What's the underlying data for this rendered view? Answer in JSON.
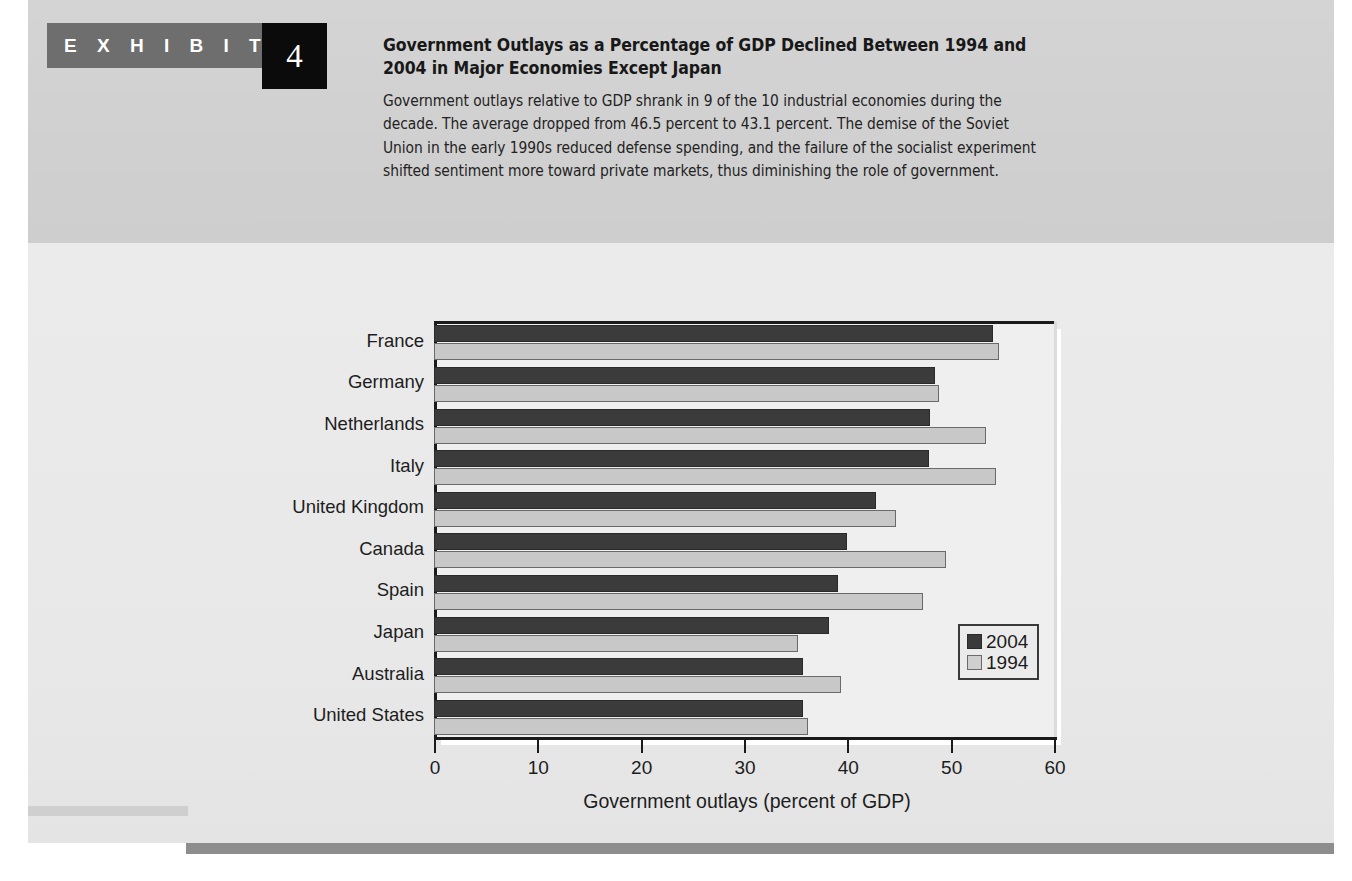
{
  "exhibit": {
    "label": "E X H I B I T",
    "number": "4",
    "title": "Government Outlays as a Percentage of GDP Declined Between 1994 and 2004 in Major Economies Except Japan",
    "description": "Government outlays relative to GDP shrank in 9 of the 10 industrial economies during the decade. The average dropped from 46.5 percent to 43.1 percent. The demise of the Soviet Union in the early 1990s reduced defense spending, and the failure of the socialist experiment shifted sentiment more toward private markets, thus diminishing the role of government."
  },
  "colors": {
    "series_2004": "#3b3b3b",
    "series_1994": "#c8c8c8",
    "ribbon": "#6e6e6e",
    "number_box": "#0b0b0b",
    "header_band": "#d2d2d2",
    "chart_paper": "#e9e9e9",
    "plot_bg": "#efefef",
    "axis": "#1b1b1b",
    "footer_bar": "#8d8d8d"
  },
  "chart_data": {
    "type": "bar",
    "orientation": "horizontal",
    "title": "",
    "xlabel": "Government outlays (percent of GDP)",
    "ylabel": "",
    "xlim": [
      0,
      60
    ],
    "xticks": [
      0,
      10,
      20,
      30,
      40,
      50,
      60
    ],
    "xtick_labels": [
      "0",
      "10",
      "20",
      "30",
      "40",
      "50",
      "60"
    ],
    "grid": false,
    "legend_position": "inside-lower-right",
    "categories": [
      "France",
      "Germany",
      "Netherlands",
      "Italy",
      "United Kingdom",
      "Canada",
      "Spain",
      "Japan",
      "Australia",
      "United States"
    ],
    "series": [
      {
        "name": "2004",
        "color": "#3b3b3b",
        "values": [
          54.1,
          48.5,
          48.0,
          47.9,
          42.8,
          40.0,
          39.1,
          38.2,
          35.7,
          35.7
        ]
      },
      {
        "name": "1994",
        "color": "#c8c8c8",
        "values": [
          54.7,
          48.9,
          53.4,
          54.4,
          44.7,
          49.5,
          47.3,
          35.2,
          39.4,
          36.2
        ]
      }
    ],
    "annotations": {
      "average_1994": "46.5 percent",
      "average_2004": "43.1 percent"
    }
  },
  "legend": {
    "entries": [
      {
        "label": "2004"
      },
      {
        "label": "1994"
      }
    ]
  }
}
